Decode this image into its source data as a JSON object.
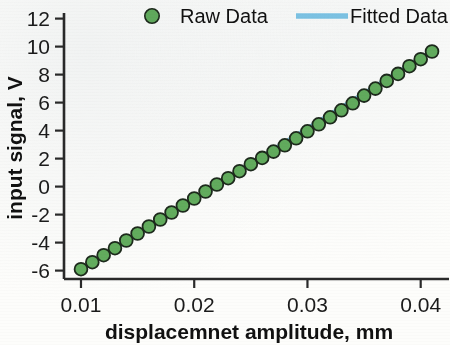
{
  "chart_data": {
    "type": "scatter",
    "title": "",
    "xlabel": "displacemnet amplitude, mm",
    "ylabel": "input signal, V",
    "xlim": [
      0.0085,
      0.0425
    ],
    "ylim": [
      -6.6,
      12.4
    ],
    "xticks": [
      0.01,
      0.02,
      0.03,
      0.04
    ],
    "xtick_labels": [
      "0.01",
      "0.02",
      "0.03",
      "0.04"
    ],
    "yticks": [
      -6,
      -4,
      -2,
      0,
      2,
      4,
      6,
      8,
      10,
      12
    ],
    "ytick_labels": [
      "-6",
      "-4",
      "-2",
      "0",
      "2",
      "4",
      "6",
      "8",
      "10",
      "12"
    ],
    "grid": false,
    "legend_position": "top",
    "series": [
      {
        "name": "Raw Data",
        "type": "scatter",
        "marker": "circle",
        "color": "#63ae5e",
        "edge_color": "#1d2a1c",
        "x": [
          0.01,
          0.011,
          0.012,
          0.013,
          0.014,
          0.015,
          0.016,
          0.017,
          0.018,
          0.019,
          0.02,
          0.021,
          0.022,
          0.023,
          0.024,
          0.025,
          0.026,
          0.027,
          0.028,
          0.029,
          0.03,
          0.031,
          0.032,
          0.033,
          0.034,
          0.035,
          0.036,
          0.037,
          0.038,
          0.039,
          0.04,
          0.041
        ],
        "y": [
          -5.9,
          -5.4,
          -4.9,
          -4.4,
          -3.85,
          -3.35,
          -2.85,
          -2.35,
          -1.85,
          -1.35,
          -0.85,
          -0.35,
          0.15,
          0.6,
          1.1,
          1.6,
          2.05,
          2.5,
          2.95,
          3.45,
          3.95,
          4.45,
          4.95,
          5.45,
          5.95,
          6.5,
          7.0,
          7.55,
          8.05,
          8.6,
          9.1,
          9.65
        ]
      },
      {
        "name": "Fitted Data",
        "type": "line",
        "color": "#7fc7e8",
        "x": [
          0.01,
          0.041
        ],
        "y": [
          -5.9,
          9.65
        ]
      }
    ]
  },
  "legend": {
    "items": [
      {
        "label": "Raw Data",
        "marker": "circle-marker",
        "color": "#63ae5e"
      },
      {
        "label": "Fitted Data",
        "marker": "line-marker",
        "color": "#7fc7e8"
      }
    ]
  },
  "axes": {
    "x_title": "displacemnet amplitude, mm",
    "y_title": "input signal, V"
  }
}
